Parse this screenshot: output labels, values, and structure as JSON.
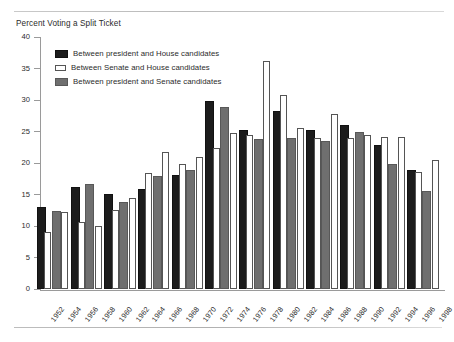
{
  "chart_data": {
    "type": "bar",
    "title": "Percent Voting a Split Ticket",
    "xlabel": "",
    "ylabel": "",
    "ylim": [
      0,
      40
    ],
    "yticks": [
      0,
      5,
      10,
      15,
      20,
      25,
      30,
      35,
      40
    ],
    "grid": false,
    "legend_position": "upper-left-inside",
    "categories": [
      "1952",
      "1954",
      "1956",
      "1958",
      "1960",
      "1962",
      "1964",
      "1966",
      "1968",
      "1970",
      "1972",
      "1974",
      "1976",
      "1978",
      "1980",
      "1982",
      "1984",
      "1986",
      "1988",
      "1990",
      "1992",
      "1994",
      "1996",
      "1998"
    ],
    "series": [
      {
        "name": "Between president and House candidates",
        "color": "#1c1c1c",
        "values": [
          12.7,
          null,
          15.8,
          null,
          14.8,
          null,
          15.5,
          null,
          17.8,
          null,
          29.6,
          null,
          24.9,
          null,
          27.9,
          null,
          25.0,
          null,
          25.7,
          null,
          22.6,
          null,
          18.5,
          null
        ]
      },
      {
        "name": "Between Senate and House candidates",
        "color": "#ffffff",
        "values": [
          9.0,
          12.3,
          10.7,
          10.0,
          12.6,
          14.4,
          18.4,
          21.8,
          19.8,
          21.0,
          22.4,
          24.8,
          24.5,
          36.2,
          30.8,
          25.6,
          24.0,
          27.8,
          24.0,
          24.4,
          24.2,
          24.2,
          18.6,
          20.4
        ]
      },
      {
        "name": "Between president and Senate candidates",
        "color": "#6f6f6f",
        "values": [
          12.1,
          null,
          16.3,
          null,
          13.5,
          null,
          17.6,
          null,
          18.6,
          null,
          28.5,
          null,
          23.5,
          null,
          23.7,
          null,
          23.1,
          null,
          24.6,
          null,
          19.6,
          null,
          15.3,
          null
        ]
      }
    ]
  },
  "figure": {
    "title": "Percent Voting a Split Ticket"
  }
}
